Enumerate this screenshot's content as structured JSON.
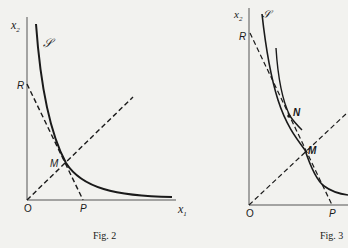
{
  "figures": [
    {
      "caption": "Fig. 2",
      "axis_labels": {
        "y": "x",
        "y_sub": "2",
        "x": "x",
        "x_sub": "1",
        "origin": "O"
      },
      "curve_label": "𝒮",
      "points": {
        "R": "R",
        "M": "M",
        "P": "P"
      }
    },
    {
      "caption": "Fig. 3",
      "axis_labels": {
        "y": "x",
        "y_sub": "2",
        "origin": "O"
      },
      "curve_label": "𝒮",
      "points": {
        "R": "R",
        "N": "N",
        "M": "M",
        "P": "P"
      }
    }
  ],
  "colors": {
    "ink": "#1a1a1a",
    "paper": "#f2f2ef"
  }
}
